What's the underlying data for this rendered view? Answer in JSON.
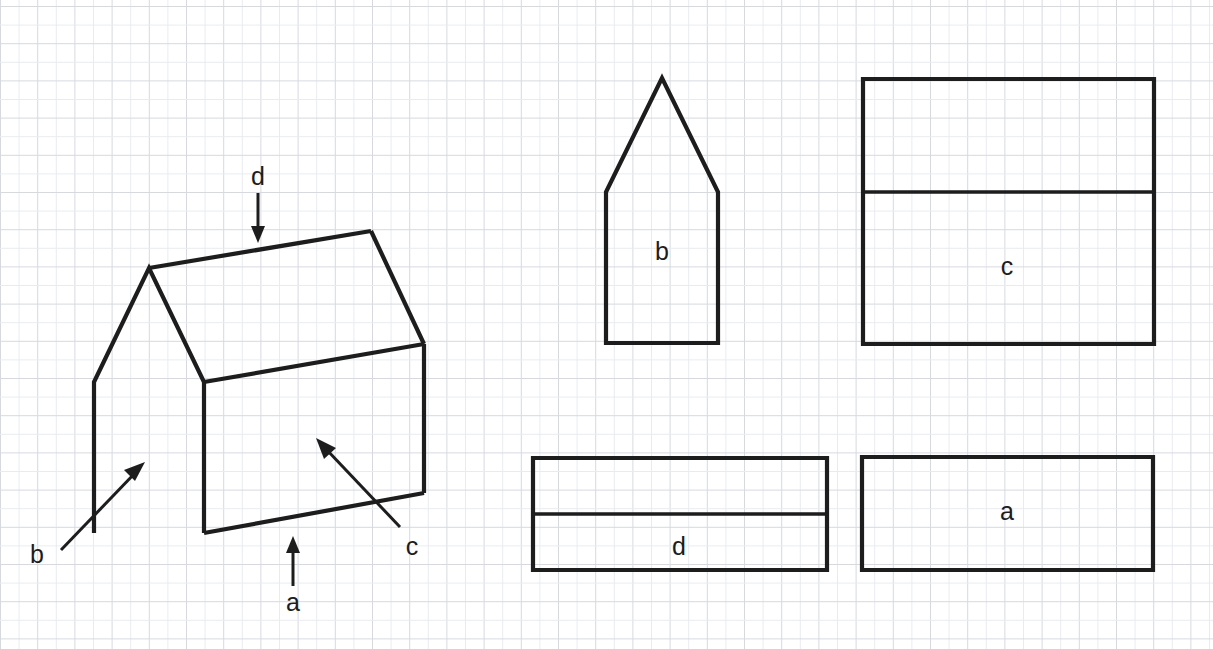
{
  "page": {
    "background_color": "#ffffff",
    "width": 1213,
    "height": 649
  },
  "grid": {
    "minor_color": "#e9ecef",
    "major_color": "#d6dade",
    "cell_size_px": 18.6,
    "major_every": 2,
    "origin_x": 0.5,
    "origin_y": 6.5
  },
  "ink": {
    "stroke_color": "#1d1d1d",
    "shape_stroke_width": 4.2,
    "divider_stroke_width": 3.6,
    "arrow_stroke_width": 3
  },
  "diagram_3d": {
    "name": "house-isometric",
    "description": "Three dimensional drawing of a house shaped prism",
    "outline_points": "94,533 94,382 149,268 204,382 204,533",
    "ridge_points": "149,268 371,231",
    "right_gable_points": "371,231 424,344",
    "eave_points": "204,382 424,344",
    "right_wall_points": "424,344 424,493",
    "base_points": "204,533 424,493",
    "callouts": [
      {
        "id": "callout-d",
        "label": "d",
        "label_x": 258,
        "label_y": 178,
        "line_x1": 258,
        "line_y1": 193,
        "line_x2": 258,
        "line_y2": 232,
        "head": "258,243 251,226 265,226",
        "direction": "down"
      },
      {
        "id": "callout-b",
        "label": "b",
        "label_x": 37,
        "label_y": 556,
        "line_x1": 61,
        "line_y1": 550,
        "line_x2": 136,
        "line_y2": 472,
        "head": "145,462 124,470 135,481",
        "direction": "up-right"
      },
      {
        "id": "callout-a",
        "label": "a",
        "label_x": 293,
        "label_y": 604,
        "line_x1": 293,
        "line_y1": 586,
        "line_x2": 293,
        "line_y2": 548,
        "head": "293,536 286,553 300,553",
        "direction": "up"
      },
      {
        "id": "callout-c",
        "label": "c",
        "label_x": 412,
        "label_y": 548,
        "line_x1": 400,
        "line_y1": 527,
        "line_x2": 326,
        "line_y2": 449,
        "head": "316,438 324,459 336,448",
        "direction": "up-left"
      }
    ]
  },
  "net_shapes": [
    {
      "id": "shape-b",
      "label": "b",
      "kind": "pentagon",
      "description": "gable end of the house — rectangle topped by a triangle",
      "points": "606,343 606,192 662,78 718,192 718,343",
      "divider": null,
      "label_x": 662,
      "label_y": 253
    },
    {
      "id": "shape-c",
      "label": "c",
      "kind": "rectangle-with-divider",
      "description": "side wall plus roof slope",
      "points": "863,79 1154,79 1154,344 863,344",
      "divider": "863,192 1154,192",
      "label_x": 1007,
      "label_y": 268
    },
    {
      "id": "shape-d",
      "label": "d",
      "kind": "rectangle-with-divider",
      "description": "roof slope strip",
      "points": "533,458 827,458 827,570 533,570",
      "divider": "533,514 827,514",
      "label_x": 679,
      "label_y": 548
    },
    {
      "id": "shape-a",
      "label": "a",
      "kind": "rectangle",
      "description": "base of the house",
      "points": "862,457 1153,457 1153,570 862,570",
      "divider": null,
      "label_x": 1007,
      "label_y": 513
    }
  ]
}
